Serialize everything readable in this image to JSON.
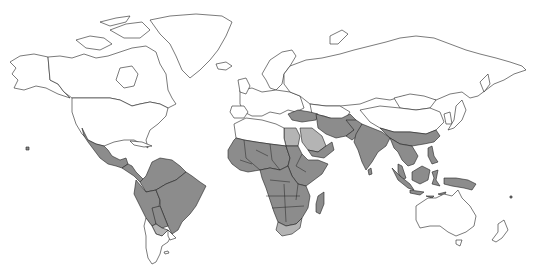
{
  "map": {
    "type": "world-choropleth",
    "projection": "equirectangular-like",
    "background": "#ffffff",
    "outline_color": "#222222",
    "categories": [
      {
        "key": "none",
        "color": "#ffffff"
      },
      {
        "key": "dark",
        "color": "#8c8c8c"
      },
      {
        "key": "light",
        "color": "#b4b4b4"
      }
    ],
    "shaded_regions": {
      "dark": [
        "Mexico",
        "Central America",
        "Colombia",
        "Venezuela",
        "Guyana",
        "Suriname",
        "French Guiana",
        "Ecuador",
        "Peru",
        "Bolivia",
        "Brazil",
        "Paraguay",
        "West Africa",
        "Central Africa",
        "East Africa",
        "Southern Africa (except South Africa)",
        "Madagascar",
        "Sudan",
        "Ethiopia",
        "Somalia",
        "Yemen",
        "Oman",
        "Turkey",
        "Iran",
        "Afghanistan",
        "Pakistan",
        "India",
        "Nepal",
        "Bangladesh",
        "Myanmar",
        "Southern China",
        "Thailand",
        "Laos",
        "Vietnam",
        "Cambodia",
        "Malaysia",
        "Indonesia",
        "Philippines",
        "Papua New Guinea"
      ],
      "light": [
        "Egypt",
        "Saudi Arabia",
        "South Africa",
        "Northern Argentina/Paraguay border"
      ]
    }
  }
}
